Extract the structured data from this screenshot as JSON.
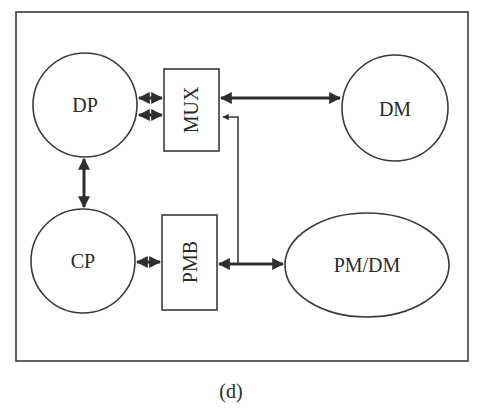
{
  "diagram": {
    "caption": "(d)",
    "nodes": {
      "dp": {
        "label": "DP",
        "shape": "circle"
      },
      "mux": {
        "label": "MUX",
        "shape": "rectangle",
        "text_orientation": "rotated-vertical"
      },
      "dm": {
        "label": "DM",
        "shape": "circle"
      },
      "cp": {
        "label": "CP",
        "shape": "circle"
      },
      "pmb": {
        "label": "PMB",
        "shape": "rectangle",
        "text_orientation": "rotated-vertical"
      },
      "pmdm": {
        "label": "PM/DM",
        "shape": "ellipse"
      }
    },
    "edges": [
      {
        "from": "DP",
        "to": "MUX",
        "type": "bidirectional",
        "count": 2
      },
      {
        "from": "MUX",
        "to": "DM",
        "type": "bidirectional"
      },
      {
        "from": "DP",
        "to": "CP",
        "type": "bidirectional"
      },
      {
        "from": "CP",
        "to": "PMB",
        "type": "bidirectional"
      },
      {
        "from": "PMB",
        "to": "PM/DM",
        "type": "bidirectional"
      },
      {
        "from": "PMB-PM/DM bus",
        "to": "MUX",
        "type": "directed"
      }
    ],
    "colors": {
      "stroke": "#3a3a3a",
      "background": "#ffffff"
    }
  }
}
